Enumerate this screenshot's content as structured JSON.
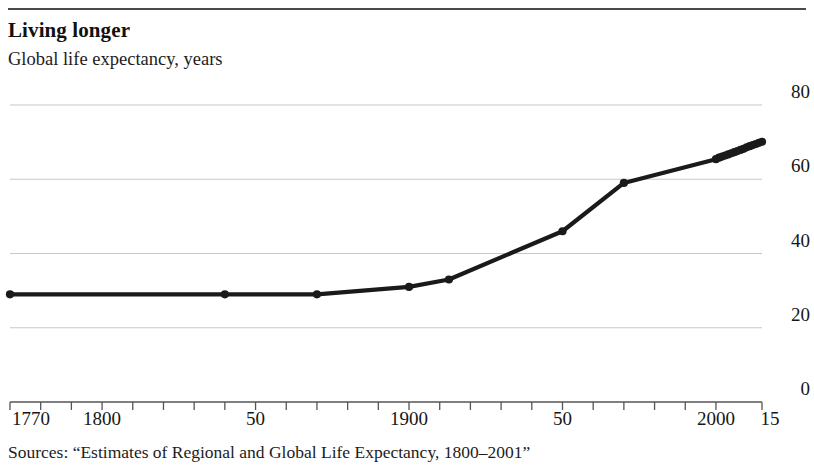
{
  "header": {
    "title": "Living longer",
    "subtitle": "Global life expectancy, years"
  },
  "footer": {
    "source": "Sources: “Estimates of Regional and Global Life Expectancy, 1800–2001”"
  },
  "style": {
    "line_color": "#1a1a1a",
    "grid_color": "#c8c8c8",
    "axis_color": "#555555",
    "rule_color": "#4a4a4a",
    "text_color": "#161616",
    "background": "#ffffff"
  },
  "chart_data": {
    "type": "line",
    "title": "Living longer",
    "subtitle": "Global life expectancy, years",
    "xlabel": "",
    "ylabel": "",
    "xlim": [
      1770,
      2015
    ],
    "ylim": [
      0,
      80
    ],
    "yticks": [
      0,
      20,
      40,
      60,
      80
    ],
    "ytick_labels": [
      "0",
      "20",
      "40",
      "60",
      "80"
    ],
    "ytick_label_position": "right",
    "xtick_values": [
      1770,
      1800,
      1850,
      1900,
      1950,
      2000,
      2015
    ],
    "xtick_labels": [
      "1770",
      "1800",
      "50",
      "1900",
      "50",
      "2000",
      "15"
    ],
    "x_minor_tick_interval": 10,
    "grid": "horizontal",
    "legend": "none",
    "markers": true,
    "series": [
      {
        "name": "Global life expectancy",
        "color": "#1a1a1a",
        "x": [
          1770,
          1840,
          1870,
          1900,
          1913,
          1950,
          1970,
          2000,
          2001,
          2002,
          2003,
          2004,
          2005,
          2006,
          2007,
          2008,
          2009,
          2010,
          2011,
          2012,
          2013,
          2014,
          2015
        ],
        "values": [
          29,
          29,
          29,
          31,
          33,
          46,
          59,
          65.4,
          65.8,
          66.1,
          66.4,
          66.7,
          67.0,
          67.3,
          67.6,
          67.9,
          68.2,
          68.6,
          68.9,
          69.2,
          69.5,
          69.8,
          70.1
        ]
      }
    ]
  }
}
